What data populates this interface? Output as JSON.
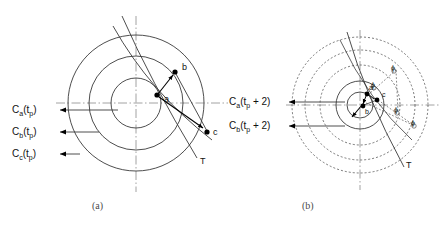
{
  "figure": {
    "width": 448,
    "height": 228,
    "background": "#ffffff",
    "stroke_color": "#3a3a3a",
    "dot_color": "#000000",
    "caption_color": "#4a4a4a"
  },
  "panel_a": {
    "caption": "(a)",
    "center": {
      "x": 136,
      "y": 103
    },
    "circles": [
      {
        "name": "inner-circle",
        "r": 25,
        "style": "solid"
      },
      {
        "name": "middle-circle",
        "r": 47,
        "style": "solid"
      },
      {
        "name": "outer-circle",
        "r": 68,
        "style": "solid"
      }
    ],
    "axes": {
      "style": "dash-dot",
      "horizontal": true,
      "vertical": true
    },
    "points": [
      {
        "id": "a",
        "label": "a",
        "x": 157,
        "y": 95
      },
      {
        "id": "b",
        "label": "b",
        "x": 175,
        "y": 72
      },
      {
        "id": "c",
        "label": "c",
        "x": 207,
        "y": 132
      }
    ],
    "tangent_label": "T",
    "contour_labels": [
      {
        "label": "C",
        "sub": "a",
        "arg": "(t",
        "argsub": "p",
        "argend": ")",
        "text": "Ca(tp)",
        "y": 111
      },
      {
        "label": "C",
        "sub": "b",
        "arg": "(t",
        "argsub": "p",
        "argend": ")",
        "text": "Cb(tp)",
        "y": 133
      },
      {
        "label": "C",
        "sub": "c",
        "arg": "(t",
        "argsub": "p",
        "argend": ")",
        "text": "Cc(tp)",
        "y": 155
      }
    ]
  },
  "panel_b": {
    "caption": "(b)",
    "center": {
      "x": 360,
      "y": 105
    },
    "circles": [
      {
        "name": "inner-circle",
        "r": 13,
        "style": "solid"
      },
      {
        "name": "second-circle",
        "r": 24,
        "style": "solid"
      },
      {
        "name": "third-circle",
        "r": 40,
        "style": "dashed"
      },
      {
        "name": "fourth-circle",
        "r": 55,
        "style": "dashed"
      },
      {
        "name": "outer-circle",
        "r": 68,
        "style": "dashed"
      }
    ],
    "axes": {
      "style": "dash-dot",
      "horizontal": true,
      "vertical": true
    },
    "points": [
      {
        "id": "a",
        "label": "a",
        "x": 367,
        "y": 94
      },
      {
        "id": "b",
        "label": "b",
        "x": 363,
        "y": 106
      },
      {
        "id": "c",
        "label": "c",
        "x": 377,
        "y": 100
      }
    ],
    "angle_marks": [
      {
        "label": "ϕ",
        "x": 393,
        "y": 73
      },
      {
        "label": "ϕ",
        "x": 374,
        "y": 88
      },
      {
        "label": "ϕ",
        "x": 396,
        "y": 113
      },
      {
        "label": "ϕ",
        "x": 412,
        "y": 125
      }
    ],
    "tangent_label": "T",
    "contour_labels": [
      {
        "text": "Ca(tp + 2)",
        "y": 103
      },
      {
        "text": "Cb(tp + 2)",
        "y": 127
      }
    ]
  }
}
